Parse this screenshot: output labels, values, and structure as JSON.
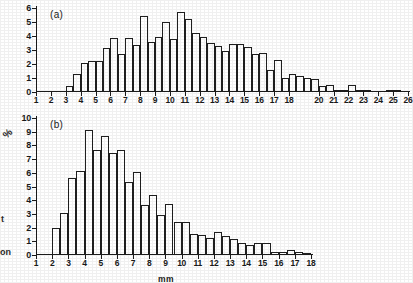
{
  "figure": {
    "panel_a_tag": "(a)",
    "panel_b_tag": "(b)",
    "percent_symbol": "%",
    "x_axis_title": "mm",
    "edge_fragment_1": "t",
    "edge_fragment_2": "on",
    "ink_color": "#1f1f1f",
    "background_color": "#ffffff"
  },
  "chart_data": [
    {
      "type": "bar",
      "title": "(a)",
      "xlabel": "",
      "ylabel": "",
      "ylim": [
        0,
        6
      ],
      "yticks": [
        0,
        1,
        2,
        3,
        4,
        5,
        6
      ],
      "xlim": [
        1,
        26
      ],
      "xticks": [
        1,
        2,
        3,
        4,
        5,
        6,
        7,
        8,
        9,
        10,
        11,
        12,
        13,
        14,
        15,
        16,
        17,
        18,
        20,
        21,
        22,
        23,
        24,
        25,
        26
      ],
      "xticklabels": [
        "1",
        "2",
        "3",
        "4",
        "5",
        "6",
        "7",
        "8",
        "9",
        "10",
        "11",
        "12",
        "13",
        "14",
        "15",
        "16",
        "17",
        "18",
        "20",
        "21",
        "22",
        "23",
        "24",
        "25",
        "26"
      ],
      "grid": false,
      "legend": null,
      "bin_width": 0.5,
      "note": "Histogram bars are half-unit wide; x values below are the left edge of each bar.",
      "x": [
        3.0,
        3.5,
        4.0,
        4.5,
        5.0,
        5.5,
        6.0,
        6.5,
        7.0,
        7.5,
        8.0,
        8.5,
        9.0,
        9.5,
        10.0,
        10.5,
        11.0,
        11.5,
        12.0,
        12.5,
        13.0,
        13.5,
        14.0,
        14.5,
        15.0,
        15.5,
        16.0,
        16.5,
        17.0,
        17.5,
        18.0,
        18.5,
        19.0,
        19.5,
        20.0,
        20.5,
        21.0,
        21.5,
        22.0,
        22.5,
        23.0,
        23.5,
        24.0,
        24.5,
        25.0,
        25.5
      ],
      "values": [
        0.4,
        1.3,
        2.05,
        2.2,
        2.2,
        3.15,
        3.85,
        2.7,
        3.85,
        3.35,
        5.45,
        3.55,
        3.95,
        5.0,
        3.8,
        5.7,
        5.2,
        4.2,
        3.95,
        3.5,
        3.3,
        2.95,
        3.45,
        3.45,
        3.2,
        2.75,
        2.8,
        1.6,
        2.3,
        1.0,
        1.3,
        1.15,
        1.0,
        0.9,
        0.4,
        0.5,
        0.15,
        0.15,
        0.5,
        0.15,
        0.15,
        0.1,
        0.1,
        0.12,
        0.12
      ]
    },
    {
      "type": "bar",
      "title": "(b)",
      "xlabel": "mm",
      "ylabel": "%",
      "ylim": [
        0,
        10
      ],
      "yticks": [
        0,
        1,
        2,
        3,
        4,
        5,
        6,
        7,
        8,
        9,
        10
      ],
      "xlim": [
        1,
        18
      ],
      "xticks": [
        1,
        2,
        3,
        4,
        5,
        6,
        7,
        8,
        9,
        10,
        11,
        12,
        13,
        14,
        15,
        16,
        17,
        18
      ],
      "xticklabels": [
        "1",
        "2",
        "3",
        "4",
        "5",
        "6",
        "7",
        "8",
        "9",
        "10",
        "11",
        "12",
        "13",
        "14",
        "15",
        "16",
        "17",
        "18"
      ],
      "grid": false,
      "legend": null,
      "bin_width": 0.5,
      "note": "Histogram bars are half-unit wide; x values below are the left edge of each bar.",
      "x": [
        2.0,
        2.5,
        3.0,
        3.5,
        4.0,
        4.5,
        5.0,
        5.5,
        6.0,
        6.5,
        7.0,
        7.5,
        8.0,
        8.5,
        9.0,
        9.5,
        10.0,
        10.5,
        11.0,
        11.5,
        12.0,
        12.5,
        13.0,
        13.5,
        14.0,
        14.5,
        15.0,
        15.5,
        16.0,
        16.5,
        17.0,
        17.5
      ],
      "values": [
        2.0,
        3.1,
        5.6,
        6.15,
        9.15,
        7.65,
        8.7,
        7.45,
        7.65,
        5.3,
        6.05,
        3.65,
        4.35,
        2.9,
        3.75,
        2.4,
        2.4,
        1.5,
        1.45,
        1.25,
        1.7,
        1.4,
        1.2,
        0.85,
        0.75,
        0.85,
        0.85,
        0.25,
        0.25,
        0.35,
        0.2,
        0.15
      ]
    }
  ]
}
